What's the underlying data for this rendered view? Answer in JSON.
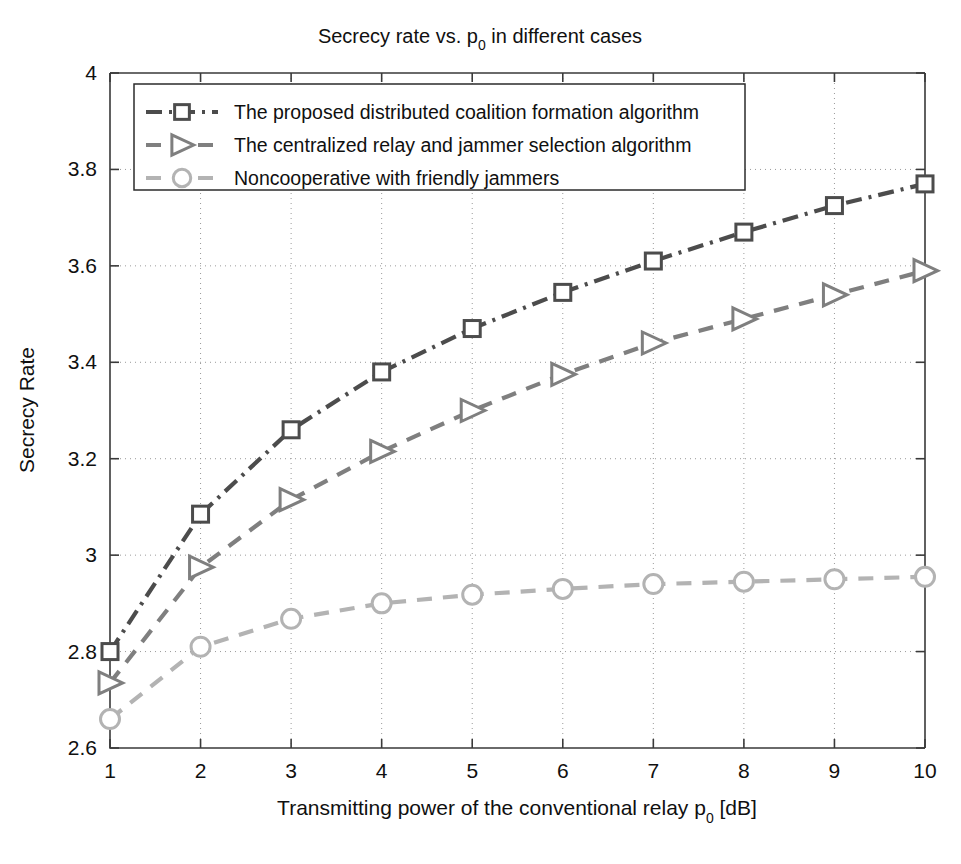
{
  "chart_data": {
    "type": "line",
    "title": "Secrecy rate vs. p0 in different cases",
    "title_main": "Secrecy rate vs. p",
    "title_sub": "0",
    "title_tail": " in different cases",
    "xlabel": "Transmitting power of the conventional relay p0 [dB]",
    "xlabel_main": "Transmitting power of the conventional relay p",
    "xlabel_sub": "0",
    "xlabel_tail": " [dB]",
    "ylabel": "Secrecy Rate",
    "x": [
      1,
      2,
      3,
      4,
      5,
      6,
      7,
      8,
      9,
      10
    ],
    "xlim": [
      1,
      10
    ],
    "ylim": [
      2.6,
      4
    ],
    "xticks": [
      "1",
      "2",
      "3",
      "4",
      "5",
      "6",
      "7",
      "8",
      "9",
      "10"
    ],
    "yticks": [
      "2.6",
      "2.8",
      "3",
      "3.2",
      "3.4",
      "3.6",
      "3.8",
      "4"
    ],
    "ytick_values": [
      2.6,
      2.8,
      3.0,
      3.2,
      3.4,
      3.6,
      3.8,
      4.0
    ],
    "grid": true,
    "legend_position": "upper left",
    "series": [
      {
        "name": "The proposed distributed coalition formation algorithm",
        "marker": "square",
        "linestyle": "dash-dot",
        "color": "#4c4c4c",
        "values": [
          2.8,
          3.085,
          3.26,
          3.38,
          3.47,
          3.545,
          3.61,
          3.67,
          3.725,
          3.77
        ]
      },
      {
        "name": "The centralized relay and jammer selection algorithm",
        "marker": "right-triangle",
        "linestyle": "dashed",
        "color": "#7f7f7f",
        "values": [
          2.735,
          2.975,
          3.115,
          3.215,
          3.3,
          3.375,
          3.44,
          3.49,
          3.54,
          3.59
        ]
      },
      {
        "name": "Noncooperative with friendly jammers",
        "marker": "circle",
        "linestyle": "dashed",
        "color": "#b3b3b3",
        "values": [
          2.66,
          2.81,
          2.868,
          2.9,
          2.918,
          2.93,
          2.94,
          2.945,
          2.95,
          2.955
        ]
      }
    ]
  }
}
